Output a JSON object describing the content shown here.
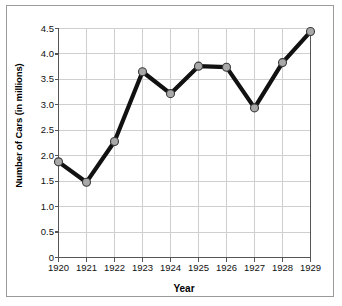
{
  "chart_data": {
    "type": "line",
    "title": "",
    "xlabel": "Year",
    "ylabel": "Number of Cars (in millions)",
    "categories": [
      "1920",
      "1921",
      "1922",
      "1923",
      "1924",
      "1925",
      "1926",
      "1927",
      "1928",
      "1929"
    ],
    "x": [
      1920,
      1921,
      1922,
      1923,
      1924,
      1925,
      1926,
      1927,
      1928,
      1929
    ],
    "values": [
      1.88,
      1.48,
      2.28,
      3.65,
      3.22,
      3.76,
      3.74,
      2.94,
      3.83,
      4.44
    ],
    "series": [
      {
        "name": "Number of Cars (in millions)",
        "values": [
          1.88,
          1.48,
          2.28,
          3.65,
          3.22,
          3.76,
          3.74,
          2.94,
          3.83,
          4.44
        ]
      }
    ],
    "ylim": [
      0,
      4.5
    ],
    "xlim": [
      1920,
      1929
    ],
    "y_ticks": [
      0,
      0.5,
      1.0,
      1.5,
      2.0,
      2.5,
      3.0,
      3.5,
      4.0,
      4.5
    ],
    "y_tick_labels": [
      "0",
      "0.5",
      "1.0",
      "1.5",
      "2.0",
      "2.5",
      "3.0",
      "3.5",
      "4.0",
      "4.5"
    ],
    "x_ticks": [
      1920,
      1921,
      1922,
      1923,
      1924,
      1925,
      1926,
      1927,
      1928,
      1929
    ],
    "x_tick_labels": [
      "1920",
      "1921",
      "1922",
      "1923",
      "1924",
      "1925",
      "1926",
      "1927",
      "1928",
      "1929"
    ],
    "grid": true,
    "grid_axis": "both",
    "legend": null,
    "legend_position": "none",
    "annotations": [],
    "marker": "circle",
    "colors": {
      "line": "#111111",
      "marker_fill": "#a8a8a8",
      "marker_edge": "#3a3a3a",
      "grid": "#cfcfcf",
      "axis": "#555555",
      "text": "#111111",
      "background": "#ffffff",
      "frame_border": "#9a9a9a"
    }
  }
}
